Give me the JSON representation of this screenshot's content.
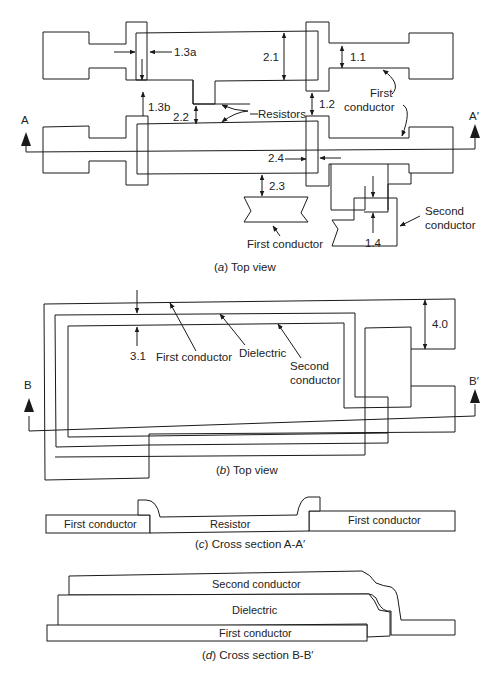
{
  "colors": {
    "line": "#1a1a1a",
    "background": "#ffffff",
    "text": "#222222"
  },
  "panel_a": {
    "caption_letter": "a",
    "caption_text": "Top view",
    "section_left": "A",
    "section_right": "A′",
    "dims": {
      "d11": "1.1",
      "d12": "1.2",
      "d13a": "1.3a",
      "d13b": "1.3b",
      "d14": "1.4",
      "d21": "2.1",
      "d22": "2.2",
      "d23": "2.3",
      "d24": "2.4"
    },
    "labels": {
      "resistors": "Resistors",
      "first_conductor_1": "First",
      "first_conductor_2": "conductor",
      "first_conductor_bottom": "First conductor",
      "second_conductor_1": "Second",
      "second_conductor_2": "conductor"
    }
  },
  "panel_b": {
    "caption_letter": "b",
    "caption_text": "Top view",
    "section_left": "B",
    "section_right": "B′",
    "dims": {
      "d31": "3.1",
      "d40": "4.0"
    },
    "labels": {
      "first_conductor": "First conductor",
      "dielectric": "Dielectric",
      "second_conductor_1": "Second",
      "second_conductor_2": "conductor"
    }
  },
  "panel_c": {
    "caption_letter": "c",
    "caption_text": "Cross section A-A′",
    "labels": {
      "left": "First conductor",
      "middle": "Resistor",
      "right": "First conductor"
    }
  },
  "panel_d": {
    "caption_letter": "d",
    "caption_text": "Cross section B-B′",
    "labels": {
      "top": "Second conductor",
      "middle": "Dielectric",
      "bottom": "First conductor"
    }
  }
}
